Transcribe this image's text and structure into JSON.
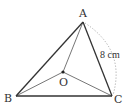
{
  "diagram": {
    "type": "geometry-triangle",
    "vertices": {
      "A": {
        "label": "A",
        "x": 83,
        "y": 22
      },
      "B": {
        "label": "B",
        "x": 16,
        "y": 96
      },
      "C": {
        "label": "C",
        "x": 112,
        "y": 96
      },
      "O": {
        "label": "O",
        "x": 63,
        "y": 72
      }
    },
    "measurement": {
      "segment": "AC",
      "label": "8 cm"
    },
    "colors": {
      "outer_edges": "#333333",
      "inner_edges": "#666666",
      "arc": "#aaaaaa",
      "background": "#ffffff"
    }
  }
}
